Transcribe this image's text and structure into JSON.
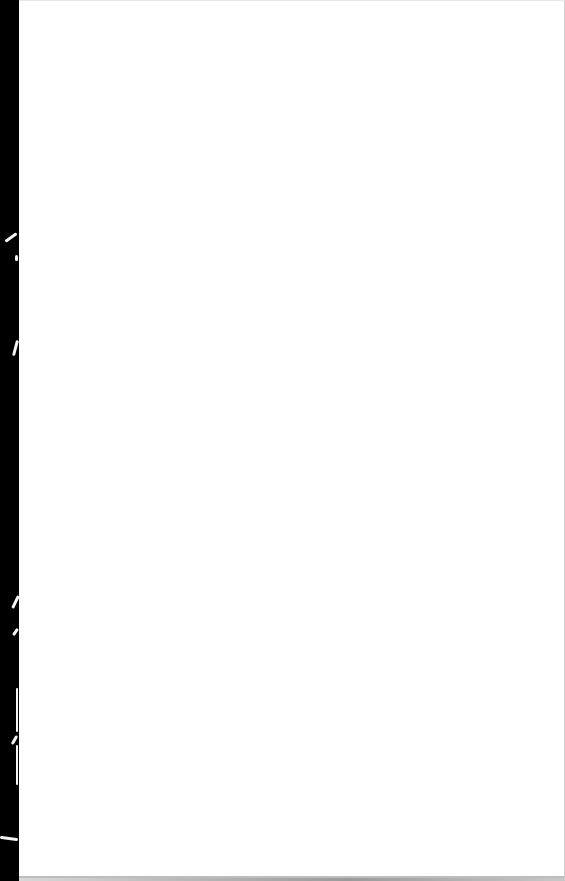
{
  "document": {
    "type": "scanned-page",
    "content": "",
    "background_color": "#ffffff",
    "margin_color": "#000000"
  }
}
